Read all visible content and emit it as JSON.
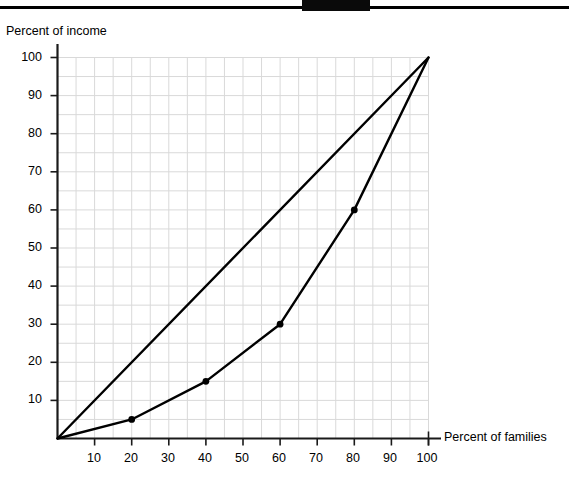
{
  "figure": {
    "top_rule": "horizontal-black-rule",
    "background_color": "#ffffff"
  },
  "chart_data": {
    "type": "line",
    "title": "",
    "xlabel": "Percent of families",
    "ylabel": "Percent of income",
    "xlim": [
      0,
      100
    ],
    "ylim": [
      0,
      100
    ],
    "xticks": [
      10,
      20,
      30,
      40,
      50,
      60,
      70,
      80,
      90,
      100
    ],
    "yticks": [
      10,
      20,
      30,
      40,
      50,
      60,
      70,
      80,
      90,
      100
    ],
    "xtick_labels": [
      "10",
      "20",
      "30",
      "40",
      "50",
      "60",
      "70",
      "80",
      "90",
      "100"
    ],
    "ytick_labels": [
      "10",
      "20",
      "30",
      "40",
      "50",
      "60",
      "70",
      "80",
      "90",
      "100"
    ],
    "grid": true,
    "grid_color": "#d9d9d9",
    "grid_step": 5,
    "legend": false,
    "legend_position": "none",
    "line_color": "#000000",
    "marker_color": "#000000",
    "series": [
      {
        "name": "Line of equality",
        "markers": false,
        "x": [
          0,
          100
        ],
        "y": [
          0,
          100
        ]
      },
      {
        "name": "Lorenz curve",
        "markers": true,
        "x": [
          0,
          20,
          40,
          60,
          80,
          100
        ],
        "y": [
          0,
          5,
          15,
          30,
          60,
          100
        ]
      }
    ],
    "annotations": []
  }
}
